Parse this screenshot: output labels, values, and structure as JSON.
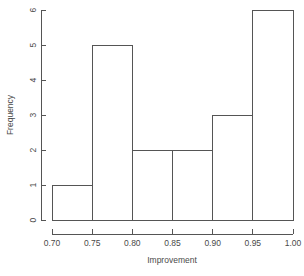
{
  "chart_data": {
    "type": "bar",
    "title": "",
    "subtitle": "",
    "xlabel": "Improvement",
    "ylabel": "Frequency",
    "bin_edges": [
      0.7,
      0.75,
      0.8,
      0.85,
      0.9,
      0.95,
      1.0
    ],
    "categories": [
      "0.70-0.75",
      "0.75-0.80",
      "0.80-0.85",
      "0.85-0.90",
      "0.90-0.95",
      "0.95-1.00"
    ],
    "values": [
      1,
      5,
      2,
      2,
      3,
      6
    ],
    "xlim": [
      0.7,
      1.0
    ],
    "ylim": [
      0,
      6
    ],
    "xticks": [
      0.7,
      0.75,
      0.8,
      0.85,
      0.9,
      0.95,
      1.0
    ],
    "xtick_labels": [
      "0.70",
      "0.75",
      "0.80",
      "0.85",
      "0.90",
      "0.95",
      "1.00"
    ],
    "yticks": [
      0,
      1,
      2,
      3,
      4,
      5,
      6
    ],
    "ytick_labels": [
      "0",
      "1",
      "2",
      "3",
      "4",
      "5",
      "6"
    ],
    "grid": false,
    "legend": false,
    "legend_position": "none",
    "bar_fill_color": "#ffffff",
    "bar_edge_color": "#555555",
    "background_color": "#ffffff",
    "annotations": []
  }
}
